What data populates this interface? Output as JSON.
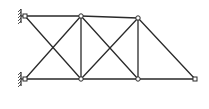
{
  "diagram": {
    "type": "truss",
    "nodes": [
      {
        "id": "A",
        "role": "top-left support"
      },
      {
        "id": "B",
        "role": "bottom-left support"
      },
      {
        "id": "C",
        "role": "top joint 1"
      },
      {
        "id": "D",
        "role": "bottom joint 1"
      },
      {
        "id": "E",
        "role": "top joint 2"
      },
      {
        "id": "F",
        "role": "bottom joint 2"
      },
      {
        "id": "G",
        "role": "tip joint"
      }
    ],
    "members": [
      [
        "A",
        "C"
      ],
      [
        "B",
        "D"
      ],
      [
        "A",
        "D"
      ],
      [
        "B",
        "C"
      ],
      [
        "C",
        "D"
      ],
      [
        "C",
        "E"
      ],
      [
        "D",
        "F"
      ],
      [
        "C",
        "F"
      ],
      [
        "D",
        "E"
      ],
      [
        "E",
        "F"
      ],
      [
        "E",
        "G"
      ],
      [
        "F",
        "G"
      ]
    ],
    "supports": [
      {
        "node": "A",
        "type": "fixed-hatched"
      },
      {
        "node": "B",
        "type": "fixed-hatched"
      }
    ],
    "colors": {
      "line": "#2a2a2a",
      "background": "#ffffff"
    }
  }
}
